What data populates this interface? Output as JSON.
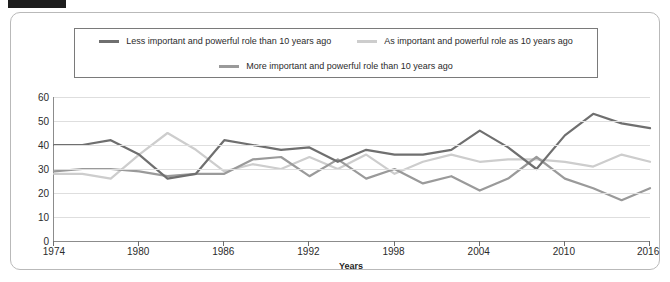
{
  "marker": {
    "name": "page-crop-marker"
  },
  "legend": {
    "position": "top",
    "entries": [
      {
        "label": "Less important and powerful role than 10 years ago",
        "color": "#6f6f6f",
        "icon": "legend-line-swatch"
      },
      {
        "label": "As important and powerful role as 10 years ago",
        "color": "#cdcdcd",
        "icon": "legend-line-swatch"
      },
      {
        "label": "More important and powerful role than 10 years ago",
        "color": "#9a9a9a",
        "icon": "legend-line-swatch"
      }
    ]
  },
  "chart_data": {
    "type": "line",
    "title": "",
    "xlabel": "Years",
    "ylabel": "",
    "xlim": [
      1974,
      2016
    ],
    "ylim": [
      0,
      60
    ],
    "grid": true,
    "y_ticks": [
      0,
      10,
      20,
      30,
      40,
      50,
      60
    ],
    "x_ticks": [
      1974,
      1980,
      1986,
      1992,
      1998,
      2004,
      2010,
      2016
    ],
    "x": [
      1974,
      1976,
      1978,
      1980,
      1982,
      1984,
      1986,
      1988,
      1990,
      1992,
      1994,
      1996,
      1998,
      2000,
      2002,
      2004,
      2006,
      2008,
      2010,
      2012,
      2014,
      2016
    ],
    "series": [
      {
        "name": "Less important and powerful role than 10 years ago",
        "color": "#6f6f6f",
        "values": [
          40,
          40,
          42,
          36,
          26,
          28,
          42,
          40,
          38,
          39,
          33,
          38,
          36,
          36,
          38,
          46,
          39,
          30,
          44,
          53,
          49,
          47
        ]
      },
      {
        "name": "As important and powerful role as 10 years ago",
        "color": "#cdcdcd",
        "values": [
          28,
          28,
          26,
          36,
          45,
          38,
          29,
          32,
          30,
          35,
          30,
          36,
          28,
          33,
          36,
          33,
          34,
          34,
          33,
          31,
          36,
          33
        ]
      },
      {
        "name": "More important and powerful role than 10 years ago",
        "color": "#9a9a9a",
        "values": [
          29,
          30,
          30,
          29,
          27,
          28,
          28,
          34,
          35,
          27,
          34,
          26,
          30,
          24,
          27,
          21,
          26,
          35,
          26,
          22,
          17,
          22
        ]
      }
    ]
  }
}
